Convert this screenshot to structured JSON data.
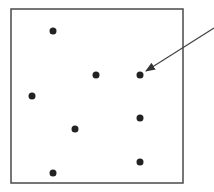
{
  "diagram": {
    "box": {
      "x": 11,
      "y": 9,
      "width": 172,
      "height": 174,
      "stroke": "#4a4a4a"
    },
    "dot_color": "#222222",
    "dot_radius": 3.5,
    "dots": [
      {
        "x": 53,
        "y": 31
      },
      {
        "x": 96,
        "y": 75
      },
      {
        "x": 140,
        "y": 75
      },
      {
        "x": 32,
        "y": 96
      },
      {
        "x": 140,
        "y": 118
      },
      {
        "x": 75,
        "y": 129
      },
      {
        "x": 140,
        "y": 162
      },
      {
        "x": 53,
        "y": 173
      }
    ],
    "arrow": {
      "x1": 214,
      "y1": 28,
      "x2": 146,
      "y2": 71,
      "color": "#444444",
      "target_dot_index": 2
    }
  }
}
